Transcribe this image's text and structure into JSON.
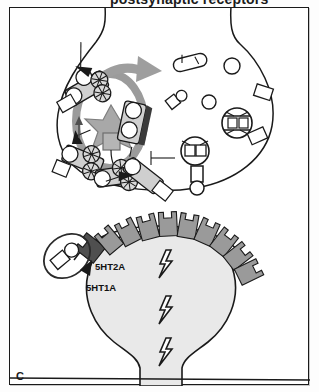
{
  "figure": {
    "panel_letter": "C",
    "cropped_heading": "postsynaptic receptors",
    "border_color": "#1a1a1a",
    "background_color": "#ffffff"
  },
  "labels": {
    "receptor_2a": "5HT2A",
    "receptor_1a": "5HT1A"
  },
  "diagram": {
    "type": "synapse-schematic",
    "presynaptic_terminal": {
      "name": "presynaptic-terminal",
      "fill": "#ffffff",
      "stroke": "#1a1a1a"
    },
    "postsynaptic_cell": {
      "name": "postsynaptic-cell",
      "fill": "#e6e6e6",
      "stroke": "#1a1a1a"
    },
    "vesicle_ring": {
      "name": "vesicle-recycling-ring",
      "fill": "#9b9b9b"
    },
    "star_organelle": {
      "name": "star-organelle",
      "fill": "#a8a8a8"
    },
    "recycling_arrow": {
      "name": "recycling-arrow",
      "fill": "#9e9e9e"
    },
    "transporter_count": 5,
    "receptor_count": 11,
    "highlighted_receptor_fill": "#4f4f4f",
    "normal_receptor_fill": "#9a9a9a",
    "bolt_count": 3,
    "bolt_color": "#1a1a1a",
    "drug_molecule_highlight": {
      "name": "drug-molecule-highlight-oval",
      "stroke": "#2a2a2a"
    },
    "cleft_molecule": {
      "name": "cleft-neurotransmitter-molecule"
    },
    "cytoplasm_vesicles": 4,
    "cytoplasm_small_molecules": 4
  }
}
